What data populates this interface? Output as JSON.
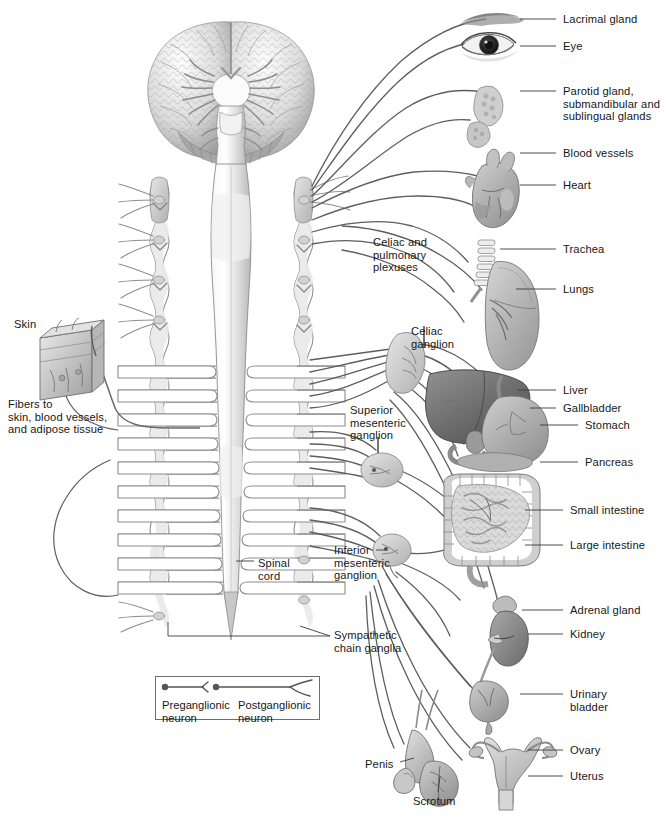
{
  "figure": {
    "view": "anterior schematic of brain, spinal cord, sympathetic chain ganglia and effector organs"
  },
  "colors": {
    "line": "#5d5d5d",
    "leader": "#3a3a3a",
    "text": "#171717",
    "organ_light": "#d6d6d6",
    "organ_mid": "#b4b4b4",
    "organ_dark": "#8d8d8d",
    "organ_darker": "#6b6b6b",
    "cord_fill": "#e3e3e3",
    "ganglion_fill": "#cfcfcf",
    "background": "#ffffff"
  },
  "labels": {
    "right_column": [
      {
        "id": "lacrimal-gland",
        "text": "Lacrimal gland",
        "x": 563,
        "y": 13,
        "leader_from_x": 556,
        "leader_from_y": 19,
        "leader_to_x": 520,
        "leader_to_y": 19
      },
      {
        "id": "eye",
        "text": "Eye",
        "x": 563,
        "y": 40,
        "leader_from_x": 556,
        "leader_from_y": 46,
        "leader_to_x": 520,
        "leader_to_y": 46
      },
      {
        "id": "parotid-gland",
        "text": "Parotid gland,\nsubmandibular and\nsublingual glands",
        "x": 563,
        "y": 85,
        "leader_from_x": 556,
        "leader_from_y": 91,
        "leader_to_x": 520,
        "leader_to_y": 91
      },
      {
        "id": "blood-vessels",
        "text": "Blood vessels",
        "x": 563,
        "y": 147,
        "leader_from_x": 556,
        "leader_from_y": 153,
        "leader_to_x": 520,
        "leader_to_y": 153
      },
      {
        "id": "heart",
        "text": "Heart",
        "x": 563,
        "y": 179,
        "leader_from_x": 556,
        "leader_from_y": 185,
        "leader_to_x": 520,
        "leader_to_y": 185
      },
      {
        "id": "trachea",
        "text": "Trachea",
        "x": 563,
        "y": 243,
        "leader_from_x": 556,
        "leader_from_y": 249,
        "leader_to_x": 500,
        "leader_to_y": 249
      },
      {
        "id": "lungs",
        "text": "Lungs",
        "x": 563,
        "y": 283,
        "leader_from_x": 556,
        "leader_from_y": 289,
        "leader_to_x": 516,
        "leader_to_y": 289
      },
      {
        "id": "liver",
        "text": "Liver",
        "x": 563,
        "y": 384,
        "leader_from_x": 556,
        "leader_from_y": 390,
        "leader_to_x": 518,
        "leader_to_y": 390
      },
      {
        "id": "gallbladder",
        "text": "Gallbladder",
        "x": 563,
        "y": 402,
        "leader_from_x": 556,
        "leader_from_y": 408,
        "leader_to_x": 530,
        "leader_to_y": 408
      },
      {
        "id": "stomach",
        "text": "Stomach",
        "x": 585,
        "y": 419,
        "leader_from_x": 578,
        "leader_from_y": 425,
        "leader_to_x": 540,
        "leader_to_y": 425
      },
      {
        "id": "pancreas",
        "text": "Pancreas",
        "x": 585,
        "y": 456,
        "leader_from_x": 578,
        "leader_from_y": 462,
        "leader_to_x": 540,
        "leader_to_y": 462
      },
      {
        "id": "small-intestine",
        "text": "Small intestine",
        "x": 570,
        "y": 504,
        "leader_from_x": 563,
        "leader_from_y": 510,
        "leader_to_x": 525,
        "leader_to_y": 510
      },
      {
        "id": "large-intestine",
        "text": "Large intestine",
        "x": 570,
        "y": 539,
        "leader_from_x": 563,
        "leader_from_y": 545,
        "leader_to_x": 525,
        "leader_to_y": 545
      },
      {
        "id": "adrenal-gland",
        "text": "Adrenal gland",
        "x": 570,
        "y": 604,
        "leader_from_x": 563,
        "leader_from_y": 610,
        "leader_to_x": 522,
        "leader_to_y": 610
      },
      {
        "id": "kidney",
        "text": "Kidney",
        "x": 570,
        "y": 628,
        "leader_from_x": 563,
        "leader_from_y": 634,
        "leader_to_x": 528,
        "leader_to_y": 634
      },
      {
        "id": "urinary-bladder",
        "text": "Urinary\nbladder",
        "x": 570,
        "y": 688,
        "leader_from_x": 563,
        "leader_from_y": 694,
        "leader_to_x": 520,
        "leader_to_y": 694
      },
      {
        "id": "ovary",
        "text": "Ovary",
        "x": 570,
        "y": 744,
        "leader_from_x": 563,
        "leader_from_y": 750,
        "leader_to_x": 528,
        "leader_to_y": 750
      },
      {
        "id": "uterus",
        "text": "Uterus",
        "x": 570,
        "y": 770,
        "leader_from_x": 563,
        "leader_from_y": 776,
        "leader_to_x": 528,
        "leader_to_y": 776
      }
    ],
    "left_column": [
      {
        "id": "skin",
        "text": "Skin",
        "x": 14,
        "y": 318
      },
      {
        "id": "fibers-to-skin",
        "text": "Fibers to\nskin, blood vessels,\nand adipose tissue",
        "x": 8,
        "y": 398
      }
    ],
    "interior": [
      {
        "id": "celiac-pulmonary-plexuses",
        "text": "Celiac and\npulmonary\nplexuses",
        "x": 373,
        "y": 236
      },
      {
        "id": "celiac-ganglion",
        "text": "Celiac\nganglion",
        "x": 411,
        "y": 325
      },
      {
        "id": "superior-mesenteric-ganglion",
        "text": "Superior\nmesenteric\nganglion",
        "x": 350,
        "y": 404
      },
      {
        "id": "inferior-mesenteric-ganglion",
        "text": "Inferior\nmesenteric\nganglion",
        "x": 334,
        "y": 544
      },
      {
        "id": "spinal-cord",
        "text": "Spinal\ncord",
        "x": 258,
        "y": 557
      },
      {
        "id": "sympathetic-chain-ganglia",
        "text": "Sympathetic\nchain ganglia",
        "x": 334,
        "y": 629
      },
      {
        "id": "penis",
        "text": "Penis",
        "x": 365,
        "y": 758
      },
      {
        "id": "scrotum",
        "text": "Scrotum",
        "x": 413,
        "y": 795
      }
    ]
  },
  "legend": {
    "box": {
      "x": 155,
      "y": 676,
      "width": 165,
      "height": 44
    },
    "entries": [
      {
        "id": "preganglionic-neuron",
        "text": "Preganglionic\nneuron",
        "x": 162,
        "y": 699,
        "symbol": "soma-dot-with-arrowhead"
      },
      {
        "id": "postganglionic-neuron",
        "text": "Postganglionic\nneuron",
        "x": 238,
        "y": 699,
        "symbol": "soma-dot-with-terminal-fork"
      }
    ]
  }
}
